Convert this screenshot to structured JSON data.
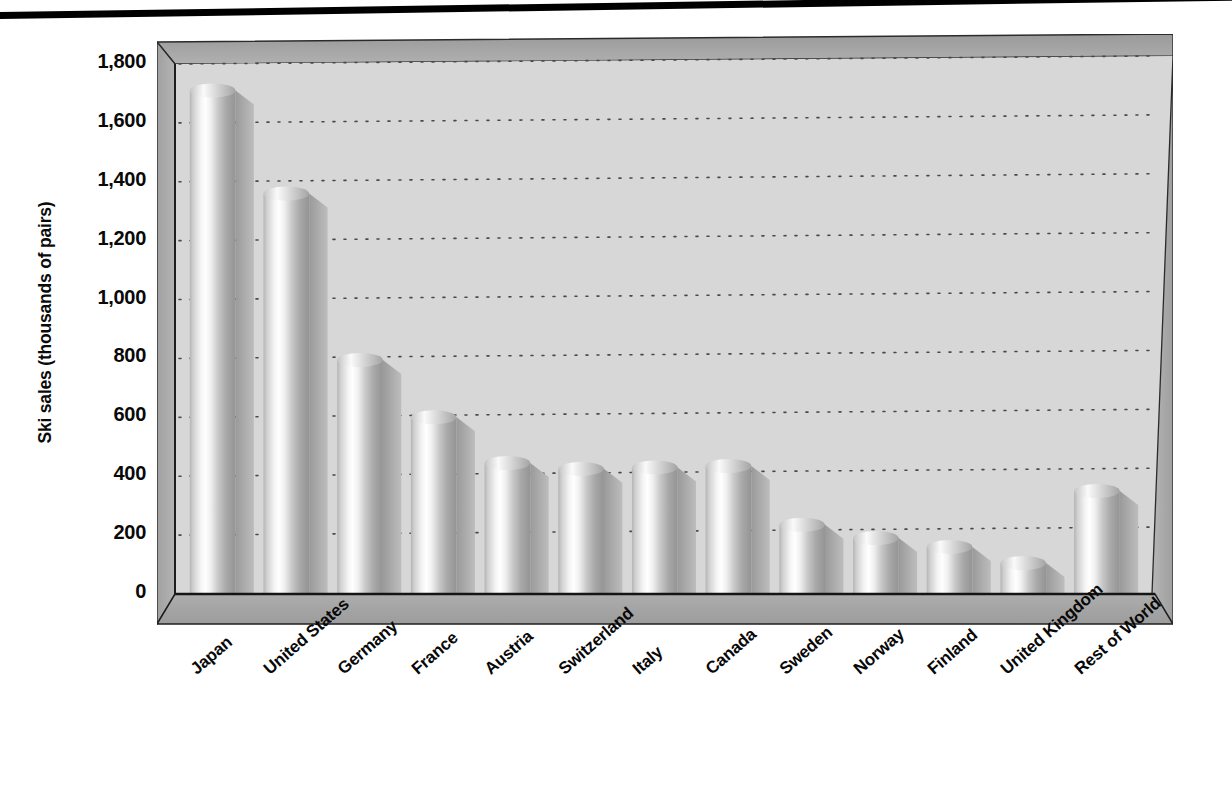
{
  "chart_data": {
    "type": "bar",
    "title": "",
    "subtitle": "",
    "xlabel": "",
    "ylabel": "Ski sales (thousands of pairs)",
    "ylim": [
      0,
      1800
    ],
    "ytick_labels": [
      "1,800",
      "1,600",
      "1,400",
      "1,200",
      "1,000",
      "800",
      "600",
      "400",
      "200",
      "0"
    ],
    "ytick_values": [
      1800,
      1600,
      1400,
      1200,
      1000,
      800,
      600,
      400,
      200,
      0
    ],
    "grid": true,
    "grid_style": "dotted-horizontal",
    "legend": "none",
    "style": "3d-cylinder-bars",
    "categories": [
      "Japan",
      "United States",
      "Germany",
      "France",
      "Austria",
      "Switzerland",
      "Italy",
      "Canada",
      "Sweden",
      "Norway",
      "Finland",
      "United Kingdom",
      "Rest of World"
    ],
    "values": [
      1710,
      1360,
      795,
      600,
      445,
      425,
      430,
      435,
      235,
      190,
      160,
      105,
      350
    ],
    "series": [
      {
        "name": "Ski sales",
        "values": [
          1710,
          1360,
          795,
          600,
          445,
          425,
          430,
          435,
          235,
          190,
          160,
          105,
          350
        ]
      }
    ]
  },
  "colors": {
    "plot_background": "#d5d5d5",
    "wall_shade": "#9d9d9d",
    "floor_shade": "#a9a9a9",
    "bar_light": "#ffffff",
    "bar_mid": "#bdbdbd",
    "bar_dark": "#8c8c8c",
    "axis_line": "#1a1a1a",
    "text": "#080808",
    "top_rule": "#000000",
    "page_background": "#ffffff"
  }
}
